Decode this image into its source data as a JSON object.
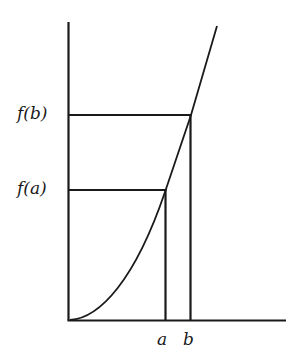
{
  "diagram": {
    "type": "function-graph",
    "colors": {
      "stroke": "#1a1a1a",
      "background": "#ffffff"
    },
    "y_labels": {
      "fb": "f(b)",
      "fa": "f(a)"
    },
    "x_labels": {
      "a": "a",
      "b": "b"
    },
    "points": [
      {
        "name": "a",
        "x_label": "a",
        "y_label": "f(a)"
      },
      {
        "name": "b",
        "x_label": "b",
        "y_label": "f(b)"
      }
    ]
  }
}
